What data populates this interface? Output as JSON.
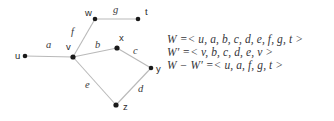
{
  "diagram": {
    "type": "undirected-graph",
    "vertices": [
      {
        "id": "u",
        "label": "u",
        "x": 25,
        "y": 56,
        "label_x": 15,
        "label_y": 59
      },
      {
        "id": "v",
        "label": "v",
        "x": 73,
        "y": 57,
        "label_x": 66,
        "label_y": 50
      },
      {
        "id": "w",
        "label": "w",
        "x": 95,
        "y": 19,
        "label_x": 85,
        "label_y": 16
      },
      {
        "id": "t",
        "label": "t",
        "x": 138,
        "y": 19,
        "label_x": 145,
        "label_y": 15
      },
      {
        "id": "x",
        "label": "x",
        "x": 117,
        "y": 48,
        "label_x": 119,
        "label_y": 41
      },
      {
        "id": "y",
        "label": "y",
        "x": 151,
        "y": 68,
        "label_x": 156,
        "label_y": 72
      },
      {
        "id": "z",
        "label": "z",
        "x": 116,
        "y": 105,
        "label_x": 123,
        "label_y": 110
      }
    ],
    "edges": [
      {
        "id": "a",
        "from": "u",
        "to": "v",
        "label": "a",
        "label_x": 46,
        "label_y": 48
      },
      {
        "id": "f",
        "from": "v",
        "to": "w",
        "label": "f",
        "label_x": 71,
        "label_y": 35
      },
      {
        "id": "g",
        "from": "w",
        "to": "t",
        "label": "g",
        "label_x": 113,
        "label_y": 13
      },
      {
        "id": "b",
        "from": "v",
        "to": "x",
        "label": "b",
        "label_x": 95,
        "label_y": 48
      },
      {
        "id": "c",
        "from": "x",
        "to": "y",
        "label": "c",
        "label_x": 133,
        "label_y": 54
      },
      {
        "id": "d",
        "from": "y",
        "to": "z",
        "label": "d",
        "label_x": 138,
        "label_y": 92
      },
      {
        "id": "e",
        "from": "v",
        "to": "z",
        "label": "e",
        "label_x": 85,
        "label_y": 88
      }
    ],
    "colors": {
      "edge": "#b9b9b9",
      "vertex": "#1a1a1a",
      "vertex_label": "#2b2b2b",
      "edge_label": "#3a3a3a",
      "equation_text": "#35353a",
      "background": "#ffffff"
    }
  },
  "equations": [
    {
      "id": "W",
      "lhs": "W",
      "rel": " =< ",
      "rhs": "u, a, b, c, d, e, f, g, t",
      "close": " >",
      "text": "W =< u, a, b, c, d, e, f, g, t >"
    },
    {
      "id": "Wprime",
      "lhs": "W′",
      "rel": " =< ",
      "rhs": "v, b, c, d, e, v",
      "close": " >",
      "text": "W′ =< v, b, c, d, e, v >"
    },
    {
      "id": "Wminus",
      "lhs": "W − W′",
      "rel": " =< ",
      "rhs": "u, a, f, g, t",
      "close": " >",
      "text": "W − W′ =< u, a, f, g, t >"
    }
  ]
}
